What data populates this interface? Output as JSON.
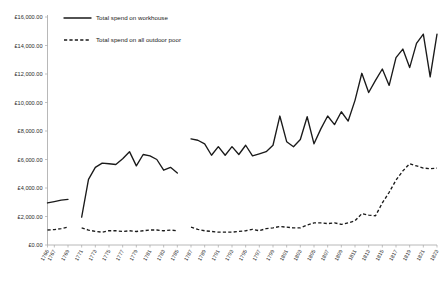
{
  "chart_data": {
    "type": "line",
    "title": "",
    "xlabel": "",
    "ylabel": "",
    "grid": false,
    "legend_position": "top-left-inside",
    "ylim": [
      0,
      16000
    ],
    "xlim": [
      1766,
      1823
    ],
    "y_tick_labels": [
      "£16,000.00",
      "£14,000.00",
      "£12,000.00",
      "£10,000.00",
      "£8,000.00",
      "£6,000.00",
      "£4,000.00",
      "£2,000.00",
      "£0.00"
    ],
    "y_tick_values": [
      16000,
      14000,
      12000,
      10000,
      8000,
      6000,
      4000,
      2000,
      0
    ],
    "x_tick_labels": [
      "1766",
      "1767",
      "1769",
      "1771",
      "1773",
      "1775",
      "1777",
      "1779",
      "1781",
      "1783",
      "1785",
      "1787",
      "1789",
      "1791",
      "1793",
      "1795",
      "1797",
      "1799",
      "1801",
      "1803",
      "1805",
      "1807",
      "1809",
      "1811",
      "1813",
      "1815",
      "1817",
      "1819",
      "1821",
      "1823"
    ],
    "x_tick_values": [
      1766,
      1767,
      1769,
      1771,
      1773,
      1775,
      1777,
      1779,
      1781,
      1783,
      1785,
      1787,
      1789,
      1791,
      1793,
      1795,
      1797,
      1799,
      1801,
      1803,
      1805,
      1807,
      1809,
      1811,
      1813,
      1815,
      1817,
      1819,
      1821,
      1823
    ],
    "series": [
      {
        "name": "Total spend on workhouse",
        "style": "solid",
        "color": "#1a1a1a",
        "x": [
          1766,
          1767,
          1768,
          1769,
          1771,
          1772,
          1773,
          1774,
          1775,
          1776,
          1777,
          1778,
          1779,
          1780,
          1781,
          1782,
          1783,
          1784,
          1785,
          1787,
          1788,
          1789,
          1790,
          1791,
          1792,
          1793,
          1794,
          1795,
          1796,
          1797,
          1798,
          1799,
          1800,
          1801,
          1802,
          1803,
          1804,
          1805,
          1806,
          1807,
          1808,
          1809,
          1810,
          1811,
          1812,
          1813,
          1814,
          1815,
          1816,
          1817,
          1818,
          1819,
          1820,
          1821,
          1822,
          1823
        ],
        "y": [
          2950,
          3050,
          3150,
          3200,
          1950,
          4600,
          5450,
          5750,
          5700,
          5650,
          6050,
          6550,
          5550,
          6350,
          6250,
          6000,
          5250,
          5450,
          5050,
          7450,
          7350,
          7100,
          6300,
          6900,
          6300,
          6900,
          6350,
          7000,
          6250,
          6400,
          6550,
          7000,
          9050,
          7250,
          6900,
          7400,
          9000,
          7100,
          8150,
          9050,
          8450,
          9350,
          8700,
          10150,
          12050,
          10700,
          11550,
          12350,
          11200,
          13150,
          13750,
          12450,
          14150,
          14800,
          11800,
          14800
        ]
      },
      {
        "name": "Total spend on all outdoor poor",
        "style": "dashed",
        "color": "#1a1a1a",
        "x": [
          1766,
          1767,
          1768,
          1769,
          1771,
          1772,
          1773,
          1774,
          1775,
          1776,
          1777,
          1778,
          1779,
          1780,
          1781,
          1782,
          1783,
          1784,
          1785,
          1787,
          1788,
          1789,
          1790,
          1791,
          1792,
          1793,
          1794,
          1795,
          1796,
          1797,
          1798,
          1799,
          1800,
          1801,
          1802,
          1803,
          1804,
          1805,
          1806,
          1807,
          1808,
          1809,
          1810,
          1811,
          1812,
          1813,
          1814,
          1815,
          1816,
          1817,
          1818,
          1819,
          1820,
          1821,
          1822,
          1823
        ],
        "y": [
          1050,
          1080,
          1150,
          1250,
          1200,
          1050,
          950,
          900,
          1000,
          1000,
          950,
          1000,
          950,
          1000,
          1050,
          1050,
          1000,
          1050,
          1000,
          1250,
          1100,
          1000,
          950,
          900,
          900,
          900,
          950,
          1000,
          1100,
          1000,
          1150,
          1200,
          1300,
          1250,
          1200,
          1200,
          1400,
          1550,
          1550,
          1500,
          1550,
          1450,
          1550,
          1700,
          2200,
          2100,
          2050,
          2950,
          3700,
          4550,
          5200,
          5700,
          5550,
          5400,
          5350,
          5400
        ]
      }
    ],
    "segment_breaks": [
      1769,
      1785
    ]
  },
  "legend": {
    "items": [
      {
        "label": "Total spend on workhouse",
        "style": "solid"
      },
      {
        "label": "Total spend on all outdoor poor",
        "style": "dashed"
      }
    ]
  }
}
